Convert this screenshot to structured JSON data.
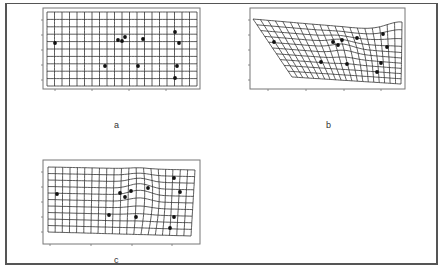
{
  "figure": {
    "border_color": "#555555",
    "grid_color": "#333333",
    "frame_color": "#777777",
    "point_color": "#111111"
  },
  "panels": [
    {
      "id": "a",
      "label": "a",
      "label_pos": [
        117,
        126
      ],
      "frame": [
        43,
        8,
        200,
        89
      ],
      "grid": {
        "cols": 20,
        "rows": 10,
        "corners": {
          "tl": [
            47,
            12
          ],
          "tr": [
            197,
            12
          ],
          "bl": [
            47,
            86
          ],
          "br": [
            197,
            86
          ]
        },
        "warp": "none"
      },
      "x_ticks": [
        55,
        92,
        129,
        166
      ],
      "y_ticks": [
        20,
        35,
        50,
        65,
        80
      ],
      "points": [
        [
          55,
          43
        ],
        [
          105,
          66
        ],
        [
          118,
          40
        ],
        [
          122,
          41
        ],
        [
          125,
          37
        ],
        [
          143,
          39
        ],
        [
          138,
          66
        ],
        [
          175,
          32
        ],
        [
          179,
          43
        ],
        [
          177,
          66
        ],
        [
          175,
          78
        ]
      ]
    },
    {
      "id": "b",
      "label": "b",
      "label_pos": [
        329,
        126
      ],
      "frame": [
        250,
        8,
        405,
        89
      ],
      "grid": {
        "cols": 20,
        "rows": 10,
        "corners": {
          "tl": [
            253,
            19
          ],
          "tr": [
            402,
            32
          ],
          "bl": [
            292,
            77
          ],
          "br": [
            401,
            84
          ]
        },
        "warp": "b"
      },
      "x_ticks": [
        268,
        306,
        344,
        381
      ],
      "y_ticks": [
        20,
        35,
        50,
        65,
        80
      ],
      "points": [
        [
          274,
          42
        ],
        [
          321,
          62
        ],
        [
          333,
          42
        ],
        [
          338,
          45
        ],
        [
          342,
          40
        ],
        [
          357,
          38
        ],
        [
          347,
          64
        ],
        [
          383,
          34
        ],
        [
          387,
          47
        ],
        [
          381,
          63
        ],
        [
          377,
          72
        ]
      ]
    },
    {
      "id": "c",
      "label": "c",
      "label_pos": [
        117,
        261
      ],
      "frame": [
        43,
        160,
        200,
        244
      ],
      "grid": {
        "cols": 20,
        "rows": 10,
        "corners": {
          "tl": [
            48,
            167
          ],
          "tr": [
            195,
            170
          ],
          "bl": [
            48,
            232
          ],
          "br": [
            191,
            236
          ]
        },
        "warp": "c"
      },
      "x_ticks": [
        50,
        91,
        132,
        172
      ],
      "y_ticks": [
        172,
        187,
        202,
        217,
        232
      ],
      "points": [
        [
          57,
          194
        ],
        [
          109,
          215
        ],
        [
          120,
          193
        ],
        [
          125,
          197
        ],
        [
          131,
          191
        ],
        [
          148,
          188
        ],
        [
          136,
          217
        ],
        [
          174,
          178
        ],
        [
          180,
          192
        ],
        [
          174,
          217
        ],
        [
          170,
          228
        ]
      ]
    }
  ]
}
